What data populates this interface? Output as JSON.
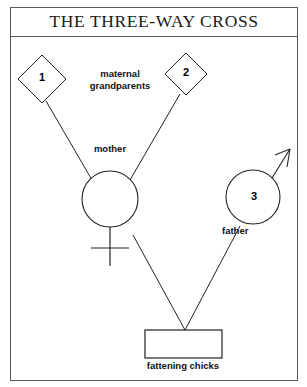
{
  "figure": {
    "title": "THE THREE-WAY CROSS",
    "background_color": "#ffffff",
    "border_color": "#5a5a5a",
    "line_color": "#222222"
  },
  "nodes": {
    "grandparent_1": {
      "number": "1",
      "shape": "diamond",
      "center": [
        42,
        79
      ],
      "half_size": 24
    },
    "grandparent_2": {
      "number": "2",
      "shape": "diamond",
      "center": [
        186,
        74
      ],
      "half_size": 21
    },
    "grandparents_label": "maternal\ngrandparents",
    "grandparents_label_line1": "maternal",
    "grandparents_label_line2": "grandparents",
    "mother": {
      "label": "mother",
      "shape": "circle-female",
      "center": [
        110,
        199
      ],
      "radius": 28
    },
    "father": {
      "label": "father",
      "number": "3",
      "shape": "circle-male",
      "center": [
        253,
        197
      ],
      "radius": 27
    },
    "offspring": {
      "label": "fattening chicks",
      "shape": "rectangle",
      "x": 145,
      "y": 330,
      "width": 77,
      "height": 28
    }
  },
  "connections": [
    {
      "from": "grandparent_1",
      "to": "mother"
    },
    {
      "from": "grandparent_2",
      "to": "mother"
    },
    {
      "from": "mother",
      "to": "offspring"
    },
    {
      "from": "father",
      "to": "offspring"
    }
  ]
}
